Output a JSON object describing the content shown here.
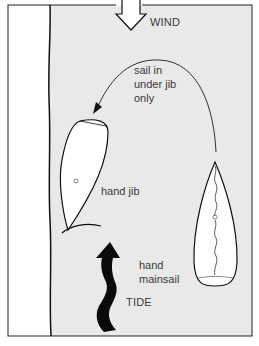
{
  "diagram": {
    "title": "",
    "colors": {
      "water": "#e9e9e9",
      "shore": "#ffffff",
      "ink": "#111111",
      "text": "#3a3a3a",
      "frame": "#222222"
    },
    "labels": {
      "wind": "WIND",
      "instruction_line1": "sail in",
      "instruction_line2": "under jib",
      "instruction_line3": "only",
      "hand_jib": "hand jib",
      "hand_mainsail_line1": "hand",
      "hand_mainsail_line2": "mainsail",
      "tide": "TIDE"
    },
    "elements": [
      {
        "id": "shore",
        "description": "white shore/quay strip on the left with wavy edge line"
      },
      {
        "id": "wind-arrow",
        "description": "hollow downward arrow at top indicating wind direction"
      },
      {
        "id": "curved-path-arrow",
        "description": "curved arrow from right boat looping up and over to the left boat"
      },
      {
        "id": "boat-left",
        "description": "boat moored alongside shore, jib sail lowered"
      },
      {
        "id": "boat-right",
        "description": "boat heading into wind with luffing mainsail"
      },
      {
        "id": "tide-arrow",
        "description": "solid black wavy upward arrow indicating tide direction"
      }
    ]
  }
}
